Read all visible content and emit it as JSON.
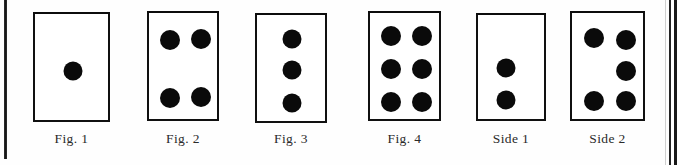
{
  "page": {
    "width": 680,
    "height": 165,
    "background_color": "#fefefe",
    "ink_color": "#0a0a0a"
  },
  "rules": {
    "left_rule_label": "left-column-rule",
    "right_rule_label": "right-column-rule"
  },
  "figures": [
    {
      "id": "fig-1",
      "caption": "Fig. 1",
      "dot_count": 1,
      "box": {
        "x": 33,
        "y": 12,
        "width": 77,
        "height": 110
      },
      "caption_y": 131,
      "dots": [
        {
          "cx": 38,
          "cy": 57,
          "r": 9.5
        }
      ]
    },
    {
      "id": "fig-2",
      "caption": "Fig. 2",
      "dot_count": 4,
      "box": {
        "x": 147,
        "y": 11,
        "width": 72,
        "height": 110
      },
      "caption_y": 131,
      "dots": [
        {
          "cx": 21,
          "cy": 27,
          "r": 10
        },
        {
          "cx": 52,
          "cy": 26,
          "r": 10
        },
        {
          "cx": 21,
          "cy": 85,
          "r": 10
        },
        {
          "cx": 52,
          "cy": 84,
          "r": 10
        }
      ]
    },
    {
      "id": "fig-3",
      "caption": "Fig. 3",
      "dot_count": 3,
      "box": {
        "x": 255,
        "y": 13,
        "width": 72,
        "height": 110
      },
      "caption_y": 131,
      "dots": [
        {
          "cx": 35,
          "cy": 24,
          "r": 9.5
        },
        {
          "cx": 35,
          "cy": 55,
          "r": 9.5
        },
        {
          "cx": 35,
          "cy": 88,
          "r": 9.5
        }
      ]
    },
    {
      "id": "fig-4",
      "caption": "Fig. 4",
      "dot_count": 6,
      "box": {
        "x": 368,
        "y": 11,
        "width": 73,
        "height": 110
      },
      "caption_y": 131,
      "dots": [
        {
          "cx": 21,
          "cy": 23,
          "r": 10
        },
        {
          "cx": 52,
          "cy": 23,
          "r": 10
        },
        {
          "cx": 21,
          "cy": 56,
          "r": 10
        },
        {
          "cx": 52,
          "cy": 56,
          "r": 10
        },
        {
          "cx": 21,
          "cy": 89,
          "r": 10
        },
        {
          "cx": 52,
          "cy": 89,
          "r": 10
        }
      ]
    },
    {
      "id": "side-1",
      "caption": "Side 1",
      "dot_count": 2,
      "box": {
        "x": 476,
        "y": 13,
        "width": 70,
        "height": 108
      },
      "caption_y": 131,
      "dots": [
        {
          "cx": 28,
          "cy": 53,
          "r": 9.5
        },
        {
          "cx": 28,
          "cy": 85,
          "r": 9.5
        }
      ]
    },
    {
      "id": "side-2",
      "caption": "Side 2",
      "dot_count": 5,
      "box": {
        "x": 570,
        "y": 11,
        "width": 75,
        "height": 110
      },
      "caption_y": 131,
      "dots": [
        {
          "cx": 22,
          "cy": 25,
          "r": 10
        },
        {
          "cx": 54,
          "cy": 27,
          "r": 10
        },
        {
          "cx": 54,
          "cy": 58,
          "r": 10
        },
        {
          "cx": 22,
          "cy": 88,
          "r": 10
        },
        {
          "cx": 54,
          "cy": 88,
          "r": 10
        }
      ]
    }
  ]
}
